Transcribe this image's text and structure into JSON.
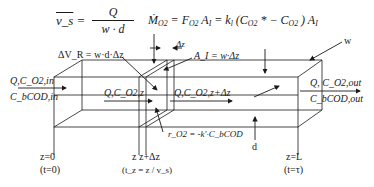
{
  "equations": {
    "superficial_velocity": {
      "lhs": "v_s",
      "numerator": "Q",
      "denominator": "w · d"
    },
    "oxygen_transfer": {
      "lhs": "Ṁ",
      "lhs_sub": "O2",
      "rhs1": "= F",
      "rhs1_sub": "O2",
      "rhs2": " A",
      "rhs2_sub": "I",
      "rhs3": " = k",
      "rhs3_sub": "l",
      "rhs4": " (C",
      "rhs4_sub": "O2",
      "rhs5": "* − C",
      "rhs5_sub": "O2",
      "rhs6": ") A",
      "rhs6_sub": "I"
    }
  },
  "labels": {
    "delta_volume": "ΔV_R = w·d·Δz",
    "delta_z": "Δz",
    "interface_area": "A_I = w·Δz",
    "width": "w",
    "depth": "d",
    "rate": "r_O2 = -k'·C_bCOD",
    "inlet_top": "Q,C_O2,in",
    "inlet_bottom": "C_bCOD,in",
    "mid_in": "Q,C_O2,z",
    "mid_out": "Q,C_O2,z+Δz",
    "outlet_top": "Q, C_O2,out",
    "outlet_bottom": "C_bCOD,out",
    "z0": "z=0",
    "t0": "(t=0)",
    "z_pos": "z z+Δz",
    "tz": "(t_z = z / v_s)",
    "zL": "z=L",
    "tL": "(t=τ)"
  }
}
